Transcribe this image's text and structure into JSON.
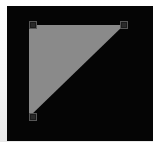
{
  "app": {
    "title": "Canvas",
    "canvas_background": "#050505",
    "frame_color": "#f2f2f2"
  },
  "canvas": {
    "label": "drawing-canvas",
    "width": 146,
    "height": 135,
    "background_color": "#050505"
  },
  "shape": {
    "type": "triangle",
    "name": "right-triangle",
    "fill_color": "#8a8a8a",
    "stroke_color": "none",
    "selected": true,
    "points": "22,19 117,19 22,111",
    "vertices": [
      {
        "name": "top-left",
        "x": 22,
        "y": 19
      },
      {
        "name": "top-right",
        "x": 117,
        "y": 19
      },
      {
        "name": "bottom-left",
        "x": 22,
        "y": 111
      }
    ]
  },
  "selection": {
    "handle_count": 3,
    "handle_fill": "#2a2a2a",
    "handle_border": "#575757",
    "handles": [
      {
        "name": "top-left",
        "x": 22,
        "y": 15
      },
      {
        "name": "top-right",
        "x": 113,
        "y": 15
      },
      {
        "name": "bottom-left",
        "x": 22,
        "y": 107
      }
    ]
  }
}
